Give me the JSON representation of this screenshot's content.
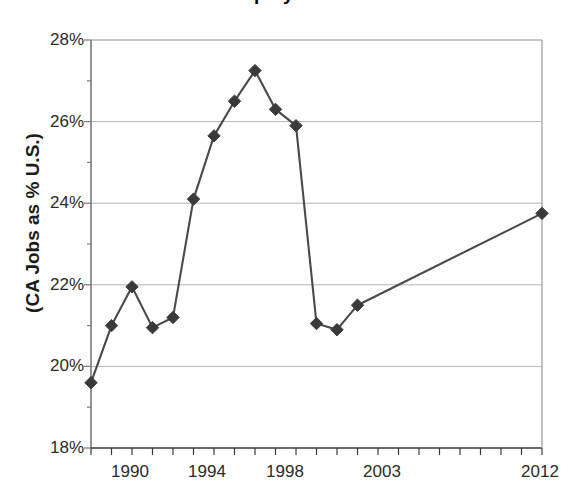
{
  "chart_data": {
    "type": "line",
    "title": "Employment",
    "xlabel": "",
    "ylabel": "(CA Jobs as % U.S.)",
    "x": [
      1990,
      1991,
      1992,
      1993,
      1994,
      1995,
      1996,
      1997,
      1998,
      1999,
      2000,
      2001,
      2002,
      2003,
      2012
    ],
    "values": [
      19.6,
      21.0,
      21.95,
      20.95,
      21.2,
      24.1,
      25.65,
      26.5,
      27.25,
      26.3,
      25.9,
      21.05,
      20.9,
      21.5,
      23.75
    ],
    "series": [
      {
        "name": "CA Jobs as % U.S.",
        "values": [
          19.6,
          21.0,
          21.95,
          20.95,
          21.2,
          24.1,
          25.65,
          26.5,
          27.25,
          26.3,
          25.9,
          21.05,
          20.9,
          21.5,
          23.75
        ]
      }
    ],
    "ylim": [
      18,
      28
    ],
    "xlim": [
      1990,
      2012
    ],
    "ytick_labels": [
      "28%",
      "26%",
      "24%",
      "22%",
      "20%",
      "18%"
    ],
    "ytick_values": [
      28,
      26,
      24,
      22,
      20,
      18
    ],
    "xtick_labels": [
      "1990",
      "1994",
      "1998",
      "2003",
      "2012"
    ],
    "xtick_values": [
      1990,
      1994,
      1998,
      2003,
      2012
    ],
    "grid": "horizontal",
    "legend": "none",
    "marker": "diamond",
    "line_color": "#4a4a4a",
    "marker_color": "#3a3a3a",
    "grid_color": "#b4b4b4",
    "axis_color": "#808080"
  },
  "axes": {
    "y_title": "(CA Jobs as % U.S.)",
    "y_ticks": [
      {
        "label": "28%",
        "value": 28
      },
      {
        "label": "26%",
        "value": 26
      },
      {
        "label": "24%",
        "value": 24
      },
      {
        "label": "22%",
        "value": 22
      },
      {
        "label": "20%",
        "value": 20
      },
      {
        "label": "18%",
        "value": 18
      }
    ],
    "x_ticks": [
      {
        "label": "1990",
        "value": 1990
      },
      {
        "label": "1994",
        "value": 1994
      },
      {
        "label": "1998",
        "value": 1998
      },
      {
        "label": "2003",
        "value": 2003
      },
      {
        "label": "2012",
        "value": 2012
      }
    ]
  },
  "header": {
    "title": "Employment"
  }
}
